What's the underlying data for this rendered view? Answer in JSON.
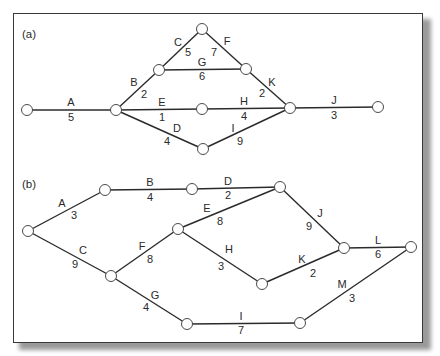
{
  "panels": [
    {
      "label": "(a)",
      "nodes": [
        {
          "id": "a1",
          "x": 27,
          "y": 110
        },
        {
          "id": "a2",
          "x": 116,
          "y": 110
        },
        {
          "id": "a3",
          "x": 159,
          "y": 70
        },
        {
          "id": "a4",
          "x": 202,
          "y": 29
        },
        {
          "id": "a5",
          "x": 246,
          "y": 69
        },
        {
          "id": "a6",
          "x": 202,
          "y": 109
        },
        {
          "id": "a7",
          "x": 290,
          "y": 108
        },
        {
          "id": "a8",
          "x": 378,
          "y": 107
        },
        {
          "id": "a9",
          "x": 203,
          "y": 149
        }
      ],
      "edges": [
        {
          "name": "A",
          "weight": "5",
          "from": "a1",
          "to": "a2",
          "nx": 71,
          "ny": 106,
          "wx": 71,
          "wy": 121
        },
        {
          "name": "B",
          "weight": "2",
          "from": "a2",
          "to": "a3",
          "nx": 134,
          "ny": 86,
          "wx": 144,
          "wy": 98
        },
        {
          "name": "C",
          "weight": "5",
          "from": "a3",
          "to": "a4",
          "nx": 178,
          "ny": 46,
          "wx": 188,
          "wy": 56
        },
        {
          "name": "F",
          "weight": "7",
          "from": "a4",
          "to": "a5",
          "nx": 227,
          "ny": 45,
          "wx": 214,
          "wy": 56
        },
        {
          "name": "G",
          "weight": "6",
          "from": "a3",
          "to": "a5",
          "nx": 202,
          "ny": 66,
          "wx": 202,
          "wy": 80
        },
        {
          "name": "K",
          "weight": "2",
          "from": "a5",
          "to": "a7",
          "nx": 272,
          "ny": 86,
          "wx": 262,
          "wy": 97
        },
        {
          "name": "E",
          "weight": "1",
          "from": "a2",
          "to": "a6",
          "nx": 162,
          "ny": 106,
          "wx": 162,
          "wy": 121
        },
        {
          "name": "H",
          "weight": "4",
          "from": "a6",
          "to": "a7",
          "nx": 244,
          "ny": 105,
          "wx": 244,
          "wy": 120
        },
        {
          "name": "D",
          "weight": "4",
          "from": "a2",
          "to": "a9",
          "nx": 177,
          "ny": 132,
          "wx": 167,
          "wy": 145
        },
        {
          "name": "I",
          "weight": "9",
          "from": "a9",
          "to": "a7",
          "nx": 233,
          "ny": 132,
          "wx": 240,
          "wy": 145
        },
        {
          "name": "J",
          "weight": "3",
          "from": "a7",
          "to": "a8",
          "nx": 334,
          "ny": 104,
          "wx": 334,
          "wy": 119
        }
      ]
    },
    {
      "label": "(b)",
      "nodes": [
        {
          "id": "b1",
          "x": 28,
          "y": 231
        },
        {
          "id": "b2",
          "x": 105,
          "y": 190
        },
        {
          "id": "b3",
          "x": 192,
          "y": 189
        },
        {
          "id": "b4",
          "x": 280,
          "y": 187
        },
        {
          "id": "b5",
          "x": 178,
          "y": 229
        },
        {
          "id": "b6",
          "x": 111,
          "y": 276
        },
        {
          "id": "b7",
          "x": 262,
          "y": 284
        },
        {
          "id": "b8",
          "x": 344,
          "y": 248
        },
        {
          "id": "b9",
          "x": 411,
          "y": 247
        },
        {
          "id": "b10",
          "x": 187,
          "y": 324
        },
        {
          "id": "b11",
          "x": 300,
          "y": 323
        }
      ],
      "edges": [
        {
          "name": "A",
          "weight": "3",
          "from": "b1",
          "to": "b2",
          "nx": 62,
          "ny": 207,
          "wx": 74,
          "wy": 219
        },
        {
          "name": "B",
          "weight": "4",
          "from": "b2",
          "to": "b3",
          "nx": 150,
          "ny": 186,
          "wx": 150,
          "wy": 201
        },
        {
          "name": "D",
          "weight": "2",
          "from": "b3",
          "to": "b4",
          "nx": 228,
          "ny": 185,
          "wx": 228,
          "wy": 199
        },
        {
          "name": "E",
          "weight": "8",
          "from": "b5",
          "to": "b4",
          "nx": 207,
          "ny": 212,
          "wx": 220,
          "wy": 225
        },
        {
          "name": "J",
          "weight": "9",
          "from": "b4",
          "to": "b8",
          "nx": 320,
          "ny": 217,
          "wx": 309,
          "wy": 230
        },
        {
          "name": "C",
          "weight": "9",
          "from": "b1",
          "to": "b6",
          "nx": 83,
          "ny": 254,
          "wx": 75,
          "wy": 268
        },
        {
          "name": "F",
          "weight": "8",
          "from": "b6",
          "to": "b5",
          "nx": 142,
          "ny": 250,
          "wx": 150,
          "wy": 263
        },
        {
          "name": "H",
          "weight": "3",
          "from": "b5",
          "to": "b7",
          "nx": 229,
          "ny": 253,
          "wx": 221,
          "wy": 270
        },
        {
          "name": "K",
          "weight": "2",
          "from": "b7",
          "to": "b8",
          "nx": 302,
          "ny": 263,
          "wx": 313,
          "wy": 277
        },
        {
          "name": "L",
          "weight": "6",
          "from": "b8",
          "to": "b9",
          "nx": 378,
          "ny": 244,
          "wx": 378,
          "wy": 258
        },
        {
          "name": "G",
          "weight": "4",
          "from": "b6",
          "to": "b10",
          "nx": 155,
          "ny": 299,
          "wx": 146,
          "wy": 311
        },
        {
          "name": "I",
          "weight": "7",
          "from": "b10",
          "to": "b11",
          "nx": 241,
          "ny": 320,
          "wx": 241,
          "wy": 334
        },
        {
          "name": "M",
          "weight": "3",
          "from": "b11",
          "to": "b9",
          "nx": 342,
          "ny": 288,
          "wx": 352,
          "wy": 302
        }
      ]
    }
  ]
}
